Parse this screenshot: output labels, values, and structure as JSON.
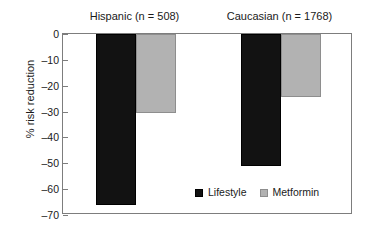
{
  "chart_data": {
    "type": "bar",
    "title": "",
    "xlabel": "",
    "ylabel": "% risk reduction",
    "ylim": [
      -70,
      0
    ],
    "yticks": [
      0,
      -10,
      -20,
      -30,
      -40,
      -50,
      -60,
      -70
    ],
    "ytick_labels": [
      "0",
      "–10",
      "–20",
      "–30",
      "–40",
      "–50",
      "–60",
      "–70"
    ],
    "grid": false,
    "legend_position": "inside bottom-right",
    "categories": [
      "Hispanic (n = 508)",
      "Caucasian (n = 1768)"
    ],
    "series": [
      {
        "name": "Lifestyle",
        "color": "#121212",
        "values": [
          -66,
          -51
        ]
      },
      {
        "name": "Metformin",
        "color": "#b2b2b2",
        "values": [
          -30.5,
          -24.5
        ]
      }
    ]
  },
  "axis": {
    "y_label": "% risk reduction"
  },
  "groups": [
    {
      "title": "Hispanic (n = 508)"
    },
    {
      "title": "Caucasian (n = 1768)"
    }
  ],
  "legend": {
    "entries": [
      {
        "label": "Lifestyle"
      },
      {
        "label": "Metformin"
      }
    ]
  }
}
